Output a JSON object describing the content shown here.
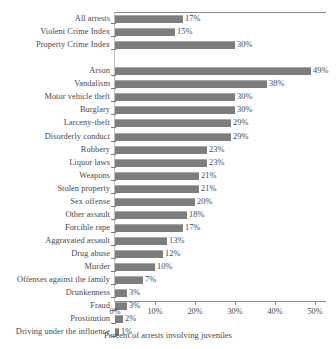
{
  "chart_data": {
    "type": "bar",
    "orientation": "horizontal",
    "title": "",
    "xlabel": "Percent of arrests involving juveniles",
    "ylabel": "",
    "xlim": [
      0,
      50
    ],
    "xunit": "%",
    "grid": false,
    "legend": null,
    "xticks": [
      "0%",
      "10%",
      "20%",
      "30%",
      "40%",
      "50%"
    ],
    "xtick_values": [
      0,
      10,
      20,
      30,
      40,
      50
    ],
    "categories": [
      "All arrests",
      "Violent Crime Index",
      "Property Crime Index",
      "Arson",
      "Vandalism",
      "Motor vehicle theft",
      "Burglary",
      "Larceny-theft",
      "Disorderly conduct",
      "Robbery",
      "Liquor laws",
      "Weapons",
      "Stolen property",
      "Sex offense",
      "Other assault",
      "Forcible rape",
      "Aggravated assault",
      "Drug abuse",
      "Murder",
      "Offenses against the family",
      "Drunkenness",
      "Fraud",
      "Prostitution",
      "Driving under the influence"
    ],
    "values": [
      17,
      15,
      30,
      49,
      38,
      30,
      30,
      29,
      29,
      23,
      23,
      21,
      21,
      20,
      18,
      17,
      13,
      12,
      10,
      7,
      3,
      3,
      2,
      1
    ],
    "value_labels": [
      "17%",
      "15%",
      "30%",
      "49%",
      "38%",
      "30%",
      "30%",
      "29%",
      "29%",
      "23%",
      "23%",
      "21%",
      "21%",
      "20%",
      "18%",
      "17%",
      "13%",
      "12%",
      "10%",
      "7%",
      "3%",
      "3%",
      "2%",
      "1%"
    ],
    "gap_after_index": 2,
    "bar_color": "#7d7d7d",
    "bar_edge_color": "#a8a8a8",
    "axis_color": "#8c8c8c",
    "text_color": "#4a4a4a"
  }
}
